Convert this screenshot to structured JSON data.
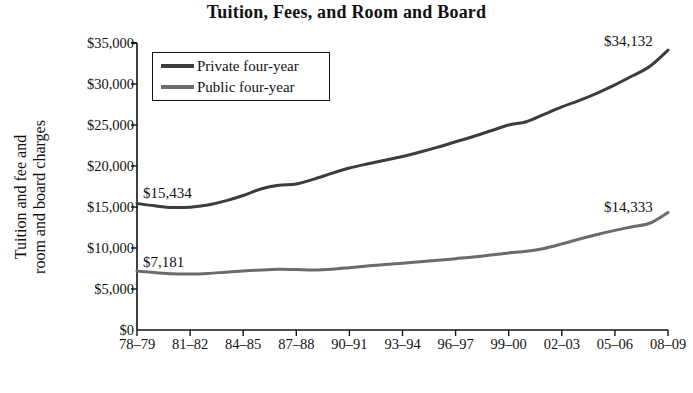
{
  "chart_data": {
    "type": "line",
    "title": "Tuition, Fees, and Room and Board",
    "xlabel": "Academic year",
    "ylabel": "Tuition and fee and room and board charges",
    "ylabel_line1": "Tuition and fee and",
    "ylabel_line2": "room and board charges",
    "ylim": [
      0,
      35000
    ],
    "yticks": [
      0,
      5000,
      10000,
      15000,
      20000,
      25000,
      30000,
      35000
    ],
    "ytick_labels": [
      "$0",
      "$5,000",
      "$10,000",
      "$15,000",
      "$20,000",
      "$25,000",
      "$30,000",
      "$35,000"
    ],
    "xtick_labels": [
      "78–79",
      "81–82",
      "84–85",
      "87–88",
      "90–91",
      "93–94",
      "96–97",
      "99–00",
      "02–03",
      "05–06",
      "08–09"
    ],
    "x": [
      "78–79",
      "79–80",
      "80–81",
      "81–82",
      "82–83",
      "83–84",
      "84–85",
      "85–86",
      "86–87",
      "87–88",
      "88–89",
      "89–90",
      "90–91",
      "91–92",
      "92–93",
      "93–94",
      "94–95",
      "95–96",
      "96–97",
      "97–98",
      "98–99",
      "99–00",
      "00–01",
      "01–02",
      "02–03",
      "03–04",
      "04–05",
      "05–06",
      "06–07",
      "07–08",
      "08–09"
    ],
    "grid": false,
    "legend_position": "upper-left-inside",
    "series": [
      {
        "name": "Private four-year",
        "color": "#3c3c3c",
        "values": [
          15434,
          15150,
          14940,
          14980,
          15250,
          15750,
          16400,
          17200,
          17650,
          17800,
          18400,
          19100,
          19750,
          20250,
          20700,
          21150,
          21700,
          22300,
          22950,
          23600,
          24300,
          25000,
          25400,
          26300,
          27200,
          28000,
          28900,
          29900,
          31000,
          32200,
          34132
        ],
        "start_label": "$15,434",
        "end_label": "$34,132"
      },
      {
        "name": "Public four-year",
        "color": "#6b6b6b",
        "values": [
          7181,
          7000,
          6850,
          6830,
          6900,
          7050,
          7200,
          7320,
          7400,
          7370,
          7330,
          7420,
          7600,
          7800,
          8000,
          8150,
          8320,
          8500,
          8700,
          8900,
          9150,
          9400,
          9600,
          9950,
          10500,
          11100,
          11650,
          12150,
          12600,
          13050,
          14333
        ],
        "start_label": "$7,181",
        "end_label": "$14,333"
      }
    ],
    "annotations": [
      {
        "text": "$15,434",
        "series": "Private four-year",
        "position": "start"
      },
      {
        "text": "$34,132",
        "series": "Private four-year",
        "position": "end"
      },
      {
        "text": "$7,181",
        "series": "Public four-year",
        "position": "start"
      },
      {
        "text": "$14,333",
        "series": "Public four-year",
        "position": "end"
      }
    ]
  },
  "legend": {
    "items": [
      {
        "label": "Private four-year",
        "color": "#3c3c3c"
      },
      {
        "label": "Public four-year",
        "color": "#6b6b6b"
      }
    ]
  }
}
